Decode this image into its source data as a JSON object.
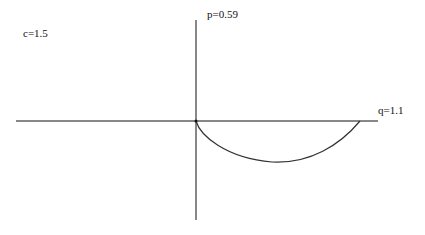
{
  "labels": {
    "c": "c=1.5",
    "p": "p=0.59",
    "q": "q=1.1"
  },
  "colors": {
    "axis": "#111111",
    "curve": "#333333",
    "background": "#ffffff"
  },
  "figure": {
    "origin_px": [
      196,
      121
    ],
    "curve_end_px": [
      360,
      121
    ],
    "curve_min_px": [
      272,
      162
    ]
  }
}
